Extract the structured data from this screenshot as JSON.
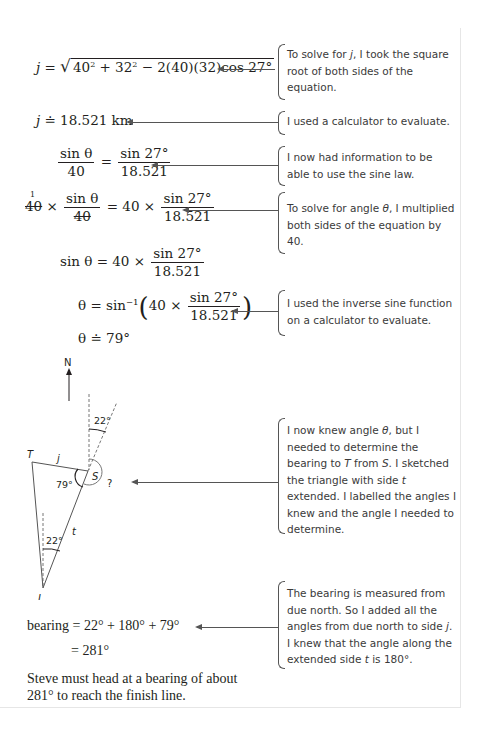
{
  "steps": [
    {
      "equation_lhs": "j",
      "equation_rhs": "√(40² + 32² − 2(40)(32)cos 27°)",
      "note": "To solve for j, I took the square root of both sides of the equation."
    },
    {
      "equation_lhs": "j",
      "equation_rel": "≐",
      "equation_rhs": "18.521 km",
      "note": "I used a calculator to evaluate."
    },
    {
      "lhs_num": "sin θ",
      "lhs_den": "40",
      "rhs_num": "sin 27°",
      "rhs_den": "18.521",
      "note": "I now had information to be able to use the sine law."
    },
    {
      "left_factor": "40",
      "lhs_num": "sin θ",
      "lhs_den": "40",
      "cancel_mark": "1",
      "rhs_factor": "40",
      "rhs_num": "sin 27°",
      "rhs_den": "18.521",
      "note": "To solve for angle θ, I multiplied both sides of the equation by 40."
    },
    {
      "lhs": "sin θ",
      "rhs_factor": "40",
      "rhs_num": "sin 27°",
      "rhs_den": "18.521"
    },
    {
      "lhs": "θ",
      "func": "sin⁻¹",
      "rhs_factor": "40",
      "rhs_num": "sin 27°",
      "rhs_den": "18.521",
      "note": "I used the inverse sine function on a calculator to evaluate."
    },
    {
      "lhs": "θ",
      "rel": "≐",
      "rhs": "79°"
    }
  ],
  "diagram": {
    "north_label": "N",
    "vertex_T": "T",
    "vertex_S": "S",
    "vertex_J": "J",
    "side_j": "j",
    "side_t": "t",
    "angle_top": "22°",
    "angle_bottom": "22°",
    "angle_S": "79°",
    "unknown": "?",
    "note": "I now knew angle θ, but I needed to determine the bearing to T from S. I sketched the triangle with side t extended. I labelled the angles I knew and the angle I needed to determine."
  },
  "bearing": {
    "label": "bearing",
    "line1": "= 22° + 180° + 79°",
    "line2": "= 281°",
    "note": "The bearing is measured from due north. So I added all the angles from due north to side j. I knew that the angle along the extended side t is 180°."
  },
  "conclusion": {
    "line1": "Steve must head at a bearing of about",
    "line2": "281° to reach the finish line."
  }
}
